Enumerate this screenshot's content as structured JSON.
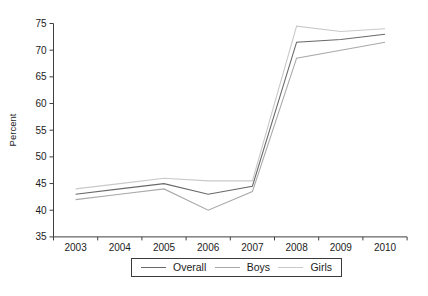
{
  "chart_data": {
    "type": "line",
    "title": "",
    "xlabel": "",
    "ylabel": "Percent",
    "x": [
      "2003",
      "2004",
      "2005",
      "2006",
      "2007",
      "2008",
      "2009",
      "2010"
    ],
    "series": [
      {
        "name": "Overall",
        "color": "#696969",
        "values": [
          43,
          44,
          45,
          43,
          44.5,
          71.5,
          72,
          73
        ]
      },
      {
        "name": "Boys",
        "color": "#a9a9a9",
        "values": [
          42,
          43,
          44,
          40,
          43.5,
          68.5,
          70,
          71.5
        ]
      },
      {
        "name": "Girls",
        "color": "#c9c9c9",
        "values": [
          44,
          45,
          46,
          45.5,
          45.5,
          74.5,
          73.5,
          74
        ]
      }
    ],
    "ylim": [
      35,
      75
    ],
    "yticks": [
      35,
      40,
      45,
      50,
      55,
      60,
      65,
      70,
      75
    ],
    "grid": false,
    "legend_position": "bottom"
  },
  "axis": {
    "line_color": "#3f3f3f",
    "text_color": "#1c1c1c"
  }
}
